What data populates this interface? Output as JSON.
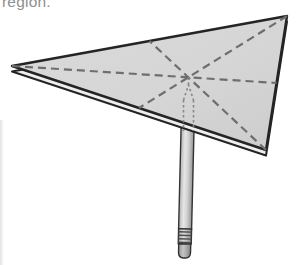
{
  "caption": {
    "text": "region."
  },
  "colors": {
    "background": "#ffffff",
    "caption_text": "#8f8f8f",
    "plate_fill": "#d6d6d6",
    "plate_outline": "#242424",
    "plate_edge_light": "#eeeeee",
    "median_dash": "#6e6e6e",
    "hidden_edge_dash": "#878787",
    "pencil_outline": "#333333",
    "pencil_shaft_light": "#e6e6e6",
    "pencil_shaft_dark": "#949494",
    "eraser_gray": "#a8a8a8"
  },
  "figure": {
    "type": "diagram",
    "plate": {
      "top_points": "12,66 287,16 266,150",
      "bottom_points": "12,71.5 287,21.5 266,155.5"
    },
    "vertices": {
      "left": {
        "x": 12,
        "y": 66
      },
      "top_right": {
        "x": 287,
        "y": 16
      },
      "bottom": {
        "x": 266,
        "y": 150
      }
    },
    "centroid": {
      "x": 188.3,
      "y": 77.3
    },
    "medians": [
      {
        "name": "median-from-left-vertex",
        "points": "12,66 276.5,83"
      },
      {
        "name": "median-from-top-right-vertex",
        "points": "287,16 139,108"
      },
      {
        "name": "median-from-bottom-vertex",
        "points": "266,150 149.5,41"
      }
    ],
    "hidden_pencil": {
      "axis_points": "188.5,77.5 188.5,85",
      "tip_cone_points": "183.5,100 188.5,85 193.5,100",
      "left_side_points": "183.5,100 183.5,131",
      "right_side_points": "193.5,100 193.5,131"
    },
    "pencil": {
      "shaft_points": "182,96 195,96 195,229 182,229",
      "ferrule_points": "182,229 195,229 195,244 182,244",
      "ridge_lines": [
        "182,232 195,232",
        "182,235.5 195,235.5",
        "182,239 195,239",
        "182,242.5 195,242.5"
      ],
      "eraser_path": "M 182.5 244 L 194.5 244 L 194.5 252.5 Q 194.5 258 189.5 258 L 187.5 258 Q 182.5 258 182.5 252.5 Z"
    }
  }
}
